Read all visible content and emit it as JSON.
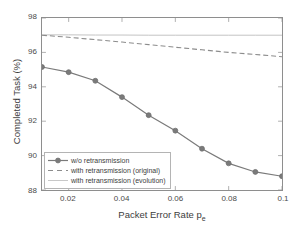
{
  "chart_data": {
    "type": "line",
    "title": "",
    "xlabel": "Packet Error Rate p",
    "xlabel_sub": "e",
    "ylabel": "Completed Task (%)",
    "xlim": [
      0.01,
      0.1
    ],
    "ylim": [
      88,
      98
    ],
    "grid": false,
    "legend_position": "lower-left",
    "x": [
      0.01,
      0.02,
      0.03,
      0.04,
      0.05,
      0.06,
      0.07,
      0.08,
      0.09,
      0.1
    ],
    "xticks": [
      "0.02",
      "0.04",
      "0.06",
      "0.08",
      "0.1"
    ],
    "xtick_values": [
      0.02,
      0.04,
      0.06,
      0.08,
      0.1
    ],
    "yticks": [
      "88",
      "90",
      "92",
      "94",
      "96",
      "98"
    ],
    "ytick_values": [
      88,
      90,
      92,
      94,
      96,
      98
    ],
    "series": [
      {
        "name": "w/o retransmission",
        "style": "solid-marker",
        "marker": "circle",
        "color": "#7a7a7a",
        "values": [
          95.15,
          94.85,
          94.35,
          93.4,
          92.35,
          91.45,
          90.4,
          89.55,
          89.05,
          88.8
        ]
      },
      {
        "name": "with retransmission (original)",
        "style": "dashed",
        "marker": "none",
        "color": "#8c8c8c",
        "values": [
          97.0,
          96.88,
          96.74,
          96.6,
          96.45,
          96.3,
          96.15,
          96.0,
          95.88,
          95.75
        ]
      },
      {
        "name": "with retransmission (evolution)",
        "style": "solid",
        "marker": "none",
        "color": "#c2c2c2",
        "values": [
          97.02,
          97.02,
          97.01,
          97.01,
          97.0,
          97.0,
          97.0,
          97.0,
          97.0,
          97.0
        ]
      }
    ]
  },
  "legend": {
    "items": [
      {
        "label": "w/o retransmission"
      },
      {
        "label": "with retransmission (original)"
      },
      {
        "label": "with retransmission (evolution)"
      }
    ]
  }
}
